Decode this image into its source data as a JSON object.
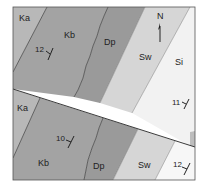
{
  "map": {
    "north_arrow": {
      "label": "N"
    },
    "colors": {
      "Ka": "#b8b8b8",
      "Kb": "#a3a3a3",
      "Dp": "#9a9a9a",
      "Sw": "#d6d6d6",
      "Si": "#f2f2f2",
      "line": "#4a4a4a",
      "frame": "#555555"
    },
    "upper_block": {
      "units": [
        {
          "code": "Ka",
          "label": "Ka"
        },
        {
          "code": "Kb",
          "label": "Kb"
        },
        {
          "code": "Dp",
          "label": "Dp"
        },
        {
          "code": "Sw",
          "label": "Sw"
        },
        {
          "code": "Si",
          "label": "Si"
        }
      ],
      "strike_dip": [
        {
          "dip": "12",
          "unit": "Kb"
        },
        {
          "dip": "11",
          "unit": "Si"
        }
      ]
    },
    "lower_block": {
      "units": [
        {
          "code": "Ka",
          "label": "Ka"
        },
        {
          "code": "Kb",
          "label": "Kb"
        },
        {
          "code": "Dp",
          "label": "Dp"
        },
        {
          "code": "Sw",
          "label": "Sw"
        },
        {
          "code": "Si",
          "label": "Si"
        }
      ],
      "strike_dip": [
        {
          "dip": "10",
          "unit": "Kb"
        },
        {
          "dip": "12",
          "unit": "Si"
        }
      ]
    }
  }
}
